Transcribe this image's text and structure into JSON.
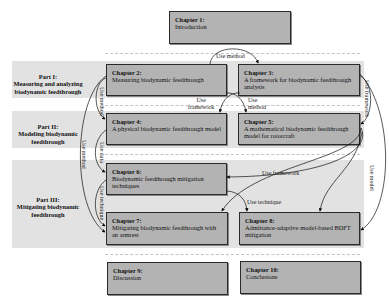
{
  "parts": [
    {
      "id": "part1",
      "label": "Part I:",
      "title": "Measuring and analyzing biodynamic feedthrough"
    },
    {
      "id": "part2",
      "label": "Part II:",
      "title": "Modeling biodynamic feedthrough"
    },
    {
      "id": "part3",
      "label": "Part III:",
      "title": "Mitigating biodynamic feedthrough"
    }
  ],
  "chapters": [
    {
      "num": "Chapter 1:",
      "title": "Introduction"
    },
    {
      "num": "Chapter 2:",
      "title": "Measuring biodynamic feedthrough"
    },
    {
      "num": "Chapter 3:",
      "title": "A framework for biodynamic feedthrough analysis"
    },
    {
      "num": "Chapter 4:",
      "title": "A physical biodynamic feedthrough model"
    },
    {
      "num": "Chapter 5:",
      "title": "A mathematical biodynamic feedthrough model for rotorcraft"
    },
    {
      "num": "Chapter 6:",
      "title": "Biodynamic feedthrough mitigation techniques"
    },
    {
      "num": "Chapter 7:",
      "title": "Mitigating biodynamic feedthrough with an armrest"
    },
    {
      "num": "Chapter 8:",
      "title": "Admittance-adaptive model-based BDFT mitigation"
    },
    {
      "num": "Chapter 9:",
      "title": "Discussion"
    },
    {
      "num": "Chapter 10:",
      "title": "Conclusions"
    }
  ],
  "edges": [
    {
      "from": "Chapter 2",
      "to": "Chapter 3",
      "label": "Use method"
    },
    {
      "from": "Chapter 3",
      "to": "Chapter 4",
      "label": "Use framework"
    },
    {
      "from": "Chapter 2",
      "to": "Chapter 5",
      "label": "Use method"
    },
    {
      "from": "Chapter 2",
      "to": "Chapter 4",
      "label": "Use method"
    },
    {
      "from": "Chapter 3",
      "to": "Chapter 5",
      "label": "Use framework"
    },
    {
      "from": "Chapter 4",
      "to": "Chapter 6",
      "label": "Use data"
    },
    {
      "from": "Chapter 2",
      "to": "Chapter 7",
      "label": "Use method"
    },
    {
      "from": "Chapter 6",
      "to": "Chapter 7",
      "label": "Use technique"
    },
    {
      "from": "Chapter 5",
      "to": "Chapter 6",
      "label": "Use framework"
    },
    {
      "from": "Chapter 6",
      "to": "Chapter 8",
      "label": "Use technique"
    },
    {
      "from": "Chapter 3",
      "to": "Chapter 8",
      "label": "Use model"
    }
  ],
  "labels": {
    "use_method": "Use method",
    "use_framework": "Use framework",
    "use_data": "Use data",
    "use_technique": "Use technique",
    "use_model": "Use model",
    "use": "Use",
    "framework": "framework",
    "method": "method"
  }
}
